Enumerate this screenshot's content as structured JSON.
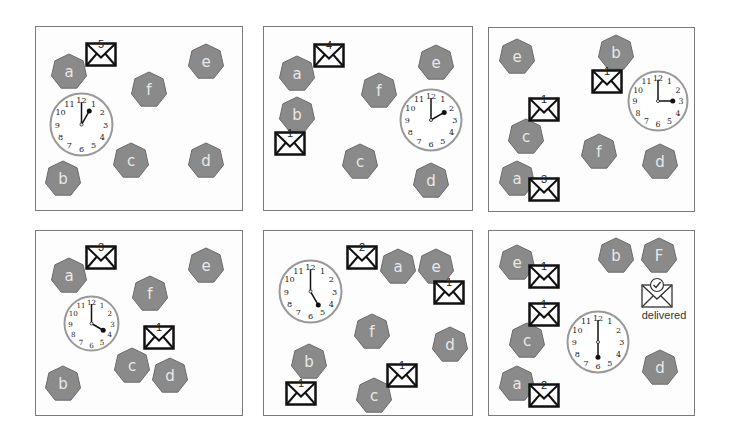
{
  "colors": {
    "node_fill": "#8a8a8a",
    "node_stroke": "#6c6c6c",
    "node_text": "#e8e8e8",
    "frame": "#7a7a7a",
    "envelope": "#111111",
    "clock_rim": "#999999"
  },
  "panels": [
    {
      "id": 1,
      "frame": {
        "x": 35,
        "y": 26,
        "w": 208,
        "h": 185
      },
      "nodes": [
        {
          "label": "a",
          "x": 50,
          "y": 53
        },
        {
          "label": "e",
          "x": 187,
          "y": 43
        },
        {
          "label": "f",
          "x": 130,
          "y": 71
        },
        {
          "label": "c",
          "x": 112,
          "y": 142
        },
        {
          "label": "d",
          "x": 187,
          "y": 142
        },
        {
          "label": "b",
          "x": 44,
          "y": 160
        }
      ],
      "envelopes": [
        {
          "number": "5",
          "x": 85,
          "y": 42
        }
      ],
      "clock": {
        "x": 49,
        "y": 92,
        "size": 65,
        "hour_angle": 30,
        "minute_angle": 0,
        "time": "1:00"
      }
    },
    {
      "id": 2,
      "frame": {
        "x": 263,
        "y": 26,
        "w": 210,
        "h": 185
      },
      "nodes": [
        {
          "label": "a",
          "x": 278,
          "y": 55
        },
        {
          "label": "e",
          "x": 417,
          "y": 44
        },
        {
          "label": "b",
          "x": 278,
          "y": 96
        },
        {
          "label": "f",
          "x": 360,
          "y": 72
        },
        {
          "label": "c",
          "x": 341,
          "y": 143
        },
        {
          "label": "d",
          "x": 412,
          "y": 162
        }
      ],
      "envelopes": [
        {
          "number": "4",
          "x": 313,
          "y": 43
        },
        {
          "number": "1",
          "x": 274,
          "y": 131
        }
      ],
      "clock": {
        "x": 399,
        "y": 88,
        "size": 64,
        "hour_angle": 60,
        "minute_angle": 0,
        "time": "2:00"
      }
    },
    {
      "id": 3,
      "frame": {
        "x": 488,
        "y": 27,
        "w": 207,
        "h": 185
      },
      "nodes": [
        {
          "label": "e",
          "x": 498,
          "y": 38
        },
        {
          "label": "b",
          "x": 597,
          "y": 34
        },
        {
          "label": "c",
          "x": 507,
          "y": 118
        },
        {
          "label": "f",
          "x": 580,
          "y": 133
        },
        {
          "label": "a",
          "x": 498,
          "y": 160
        },
        {
          "label": "d",
          "x": 641,
          "y": 143
        }
      ],
      "envelopes": [
        {
          "number": "1",
          "x": 591,
          "y": 69
        },
        {
          "number": "1",
          "x": 528,
          "y": 97
        },
        {
          "number": "3",
          "x": 528,
          "y": 177
        }
      ],
      "clock": {
        "x": 627,
        "y": 70,
        "size": 62,
        "hour_angle": 90,
        "minute_angle": 0,
        "time": "3:00"
      }
    },
    {
      "id": 4,
      "frame": {
        "x": 35,
        "y": 230,
        "w": 208,
        "h": 186
      },
      "nodes": [
        {
          "label": "a",
          "x": 50,
          "y": 257
        },
        {
          "label": "e",
          "x": 187,
          "y": 247
        },
        {
          "label": "f",
          "x": 131,
          "y": 275
        },
        {
          "label": "c",
          "x": 113,
          "y": 347
        },
        {
          "label": "d",
          "x": 151,
          "y": 357
        },
        {
          "label": "b",
          "x": 44,
          "y": 365
        }
      ],
      "envelopes": [
        {
          "number": "3",
          "x": 85,
          "y": 245
        },
        {
          "number": "1",
          "x": 143,
          "y": 325
        }
      ],
      "clock": {
        "x": 63,
        "y": 295,
        "size": 57,
        "hour_angle": 120,
        "minute_angle": 0,
        "time": "4:00"
      }
    },
    {
      "id": 5,
      "frame": {
        "x": 263,
        "y": 230,
        "w": 210,
        "h": 186
      },
      "nodes": [
        {
          "label": "a",
          "x": 379,
          "y": 248
        },
        {
          "label": "e",
          "x": 417,
          "y": 248
        },
        {
          "label": "f",
          "x": 353,
          "y": 313
        },
        {
          "label": "d",
          "x": 431,
          "y": 326
        },
        {
          "label": "b",
          "x": 290,
          "y": 343
        },
        {
          "label": "c",
          "x": 355,
          "y": 377
        }
      ],
      "envelopes": [
        {
          "number": "2",
          "x": 346,
          "y": 245
        },
        {
          "number": "1",
          "x": 433,
          "y": 280
        },
        {
          "number": "1",
          "x": 386,
          "y": 363
        },
        {
          "number": "1",
          "x": 285,
          "y": 381
        }
      ],
      "clock": {
        "x": 278,
        "y": 259,
        "size": 65,
        "hour_angle": 150,
        "minute_angle": 0,
        "time": "5:00"
      }
    },
    {
      "id": 6,
      "frame": {
        "x": 488,
        "y": 230,
        "w": 207,
        "h": 186
      },
      "nodes": [
        {
          "label": "e",
          "x": 498,
          "y": 244
        },
        {
          "label": "b",
          "x": 597,
          "y": 237
        },
        {
          "label": "F",
          "x": 640,
          "y": 237
        },
        {
          "label": "c",
          "x": 508,
          "y": 322
        },
        {
          "label": "a",
          "x": 498,
          "y": 365
        },
        {
          "label": "d",
          "x": 641,
          "y": 349
        }
      ],
      "envelopes": [
        {
          "number": "1",
          "x": 528,
          "y": 264
        },
        {
          "number": "1",
          "x": 528,
          "y": 302
        },
        {
          "number": "2",
          "x": 528,
          "y": 383
        }
      ],
      "clock": {
        "x": 566,
        "y": 310,
        "size": 64,
        "hour_angle": 180,
        "minute_angle": 0,
        "time": "6:00"
      },
      "delivered": {
        "label": "delivered",
        "x": 640,
        "y": 277
      }
    }
  ],
  "clock_numbers": [
    "12",
    "1",
    "2",
    "3",
    "4",
    "5",
    "6",
    "7",
    "8",
    "9",
    "10",
    "11"
  ]
}
